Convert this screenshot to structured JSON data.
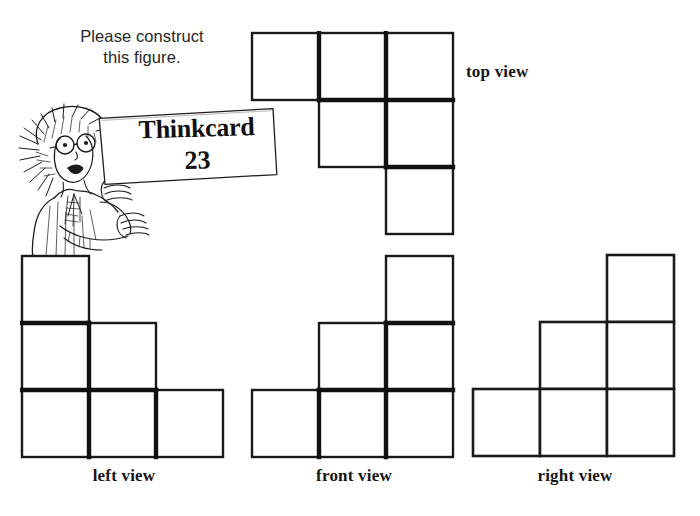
{
  "worksheet": {
    "instruction": "Please construct\nthis figure.",
    "instruction_line1": "Please construct",
    "instruction_line2": "this figure.",
    "card": {
      "title": "Thinkcard",
      "number": "23"
    },
    "colors": {
      "background": "#ffffff",
      "ink": "#141414",
      "grid_outer": "#1a1a1a",
      "grid_inner": "#111111"
    }
  },
  "views": {
    "top": {
      "label": "top view",
      "cell_size": 67,
      "rows": 3,
      "cols": 3,
      "filled": [
        [
          1,
          1,
          1
        ],
        [
          0,
          1,
          1
        ],
        [
          0,
          0,
          1
        ]
      ]
    },
    "left": {
      "label": "left view",
      "cell_size": 67,
      "rows": 3,
      "cols": 3,
      "filled": [
        [
          1,
          0,
          0
        ],
        [
          1,
          1,
          0
        ],
        [
          1,
          1,
          1
        ]
      ]
    },
    "front": {
      "label": "front view",
      "cell_size": 67,
      "rows": 3,
      "cols": 3,
      "filled": [
        [
          0,
          0,
          1
        ],
        [
          0,
          1,
          1
        ],
        [
          1,
          1,
          1
        ]
      ]
    },
    "right": {
      "label": "right view",
      "cell_size": 67,
      "rows": 3,
      "cols": 3,
      "filled": [
        [
          0,
          0,
          1
        ],
        [
          0,
          1,
          1
        ],
        [
          1,
          1,
          1
        ]
      ]
    }
  }
}
